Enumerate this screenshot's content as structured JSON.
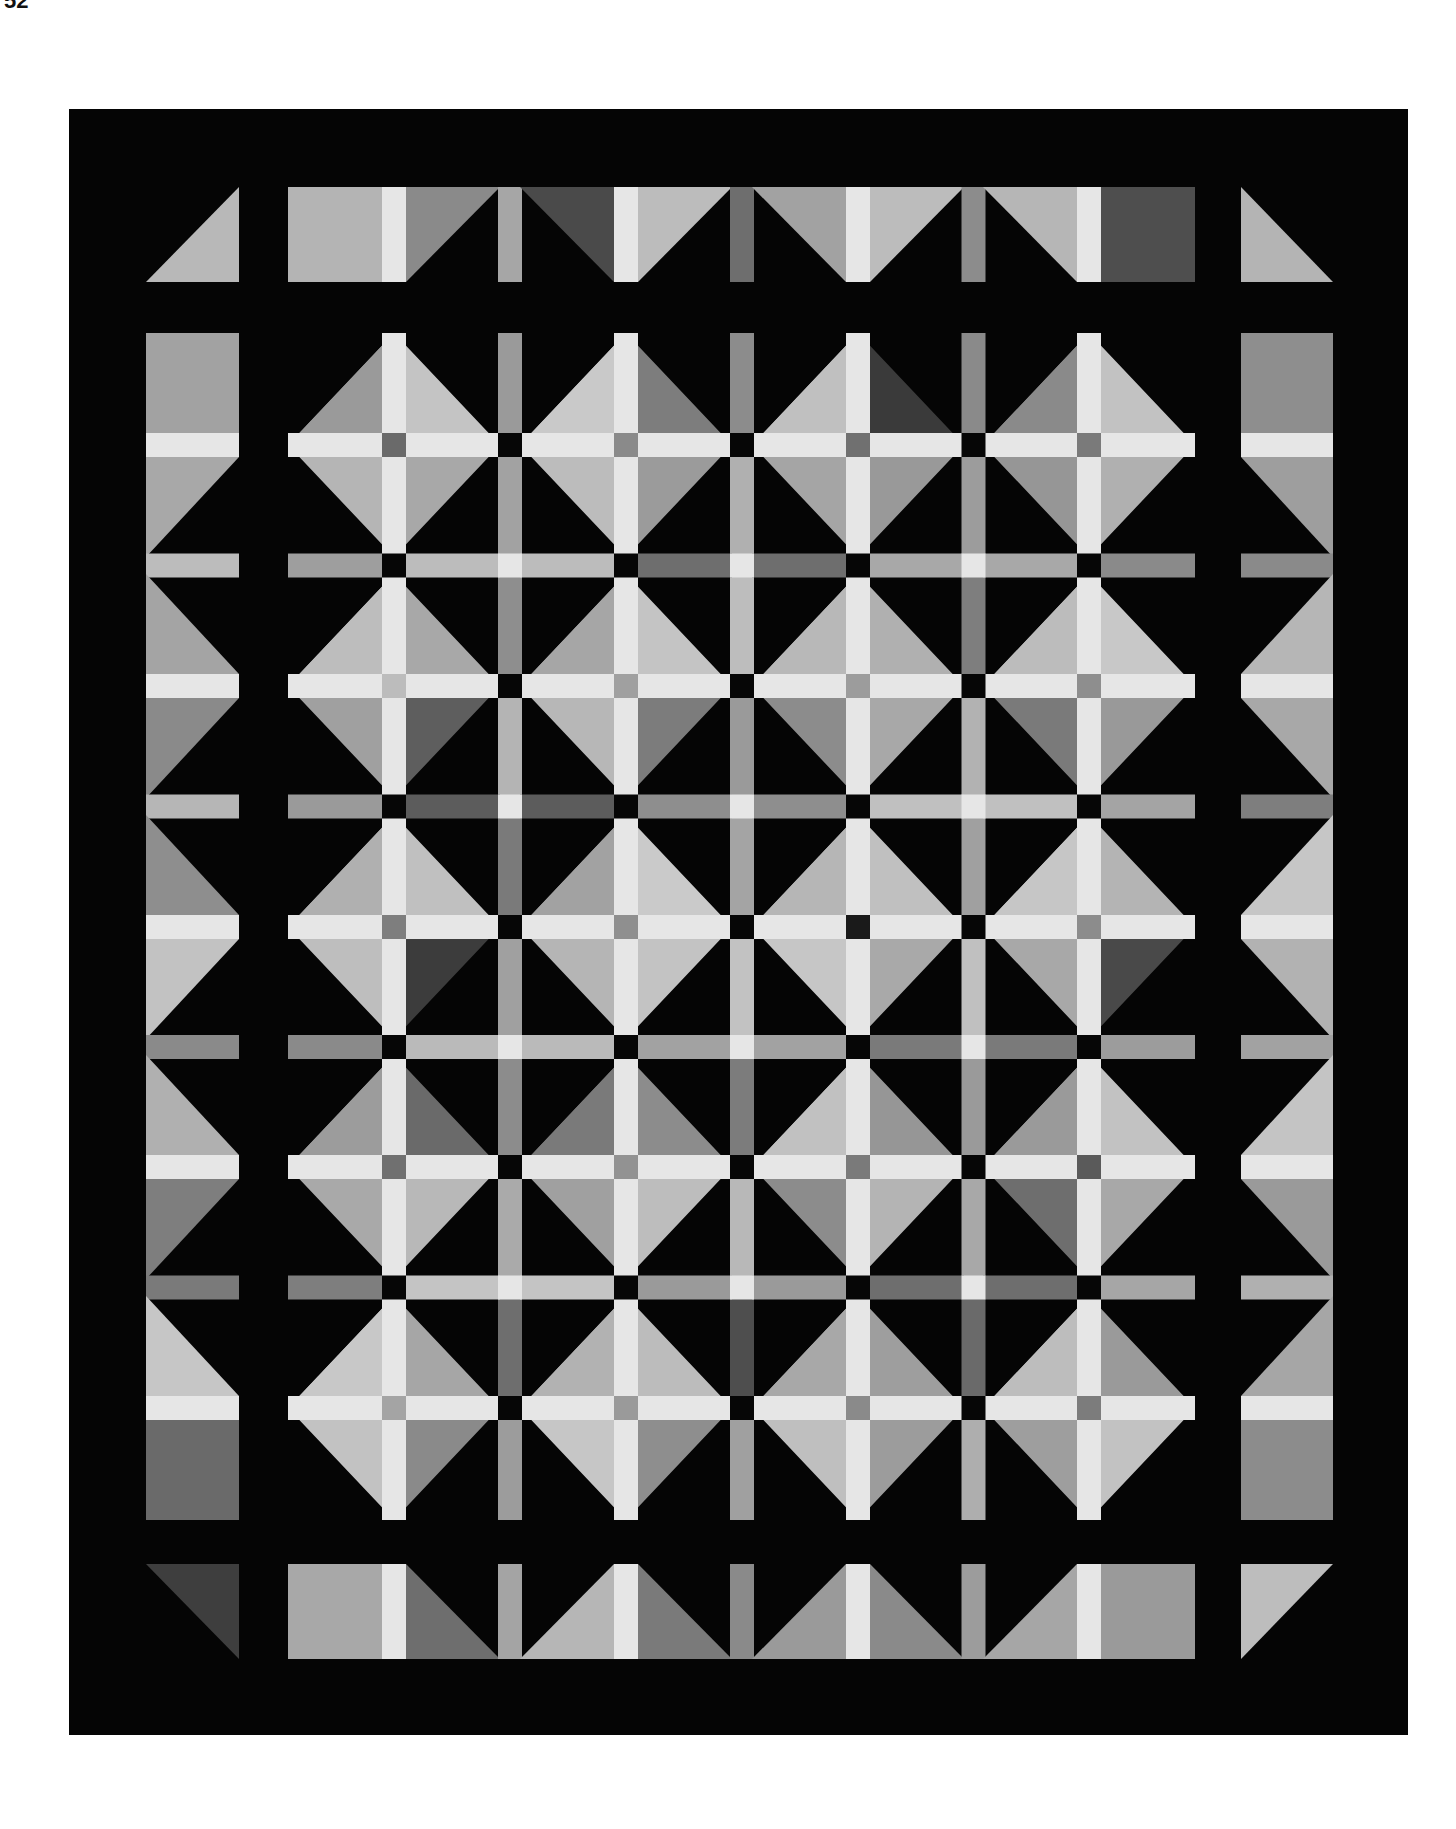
{
  "page": {
    "number": "52",
    "background": "#ffffff"
  },
  "quilt": {
    "description": "Grayscale photograph of a pieced quilt: diamond blocks split by light cross sashing on a black background",
    "colors": {
      "background": "#050505",
      "sashing": "#e6e6e6",
      "intersection": "#060606"
    },
    "bounds": {
      "x": 69,
      "y": 109,
      "w": 1339,
      "h": 1626
    },
    "grid": {
      "cols": 4,
      "rows": 5,
      "col_centers": [
        394,
        626,
        858,
        1089
      ],
      "row_centers": [
        445,
        686,
        927,
        1167,
        1408
      ],
      "half_w": 106,
      "half_h": 112,
      "sash": 24
    },
    "blocks": [
      {
        "tl": "#9a9a9a",
        "tr": "#c4c4c4",
        "bl": "#b5b5b5",
        "br": "#a8a8a8",
        "center": "#6a6a6a"
      },
      {
        "tl": "#c9c9c9",
        "tr": "#7d7d7d",
        "bl": "#bcbcbc",
        "br": "#9b9b9b",
        "center": "#8a8a8a"
      },
      {
        "tl": "#c0c0c0",
        "tr": "#3a3a3a",
        "bl": "#a5a5a5",
        "br": "#999999",
        "center": "#707070"
      },
      {
        "tl": "#8a8a8a",
        "tr": "#c2c2c2",
        "bl": "#969696",
        "br": "#b0b0b0",
        "center": "#7a7a7a"
      },
      {
        "tl": "#bdbdbd",
        "tr": "#a8a8a8",
        "bl": "#a0a0a0",
        "br": "#5e5e5e",
        "center": "#bcbcbc"
      },
      {
        "tl": "#a6a6a6",
        "tr": "#c4c4c4",
        "bl": "#b7b7b7",
        "br": "#7c7c7c",
        "center": "#a0a0a0"
      },
      {
        "tl": "#b8b8b8",
        "tr": "#b0b0b0",
        "bl": "#8c8c8c",
        "br": "#a8a8a8",
        "center": "#9c9c9c"
      },
      {
        "tl": "#bcbcbc",
        "tr": "#c8c8c8",
        "bl": "#7a7a7a",
        "br": "#999999",
        "center": "#8e8e8e"
      },
      {
        "tl": "#b0b0b0",
        "tr": "#c0c0c0",
        "bl": "#bebebe",
        "br": "#3c3c3c",
        "center": "#7e7e7e"
      },
      {
        "tl": "#a2a2a2",
        "tr": "#cacaca",
        "bl": "#b5b5b5",
        "br": "#c3c3c3",
        "center": "#8f8f8f"
      },
      {
        "tl": "#b6b6b6",
        "tr": "#c0c0c0",
        "bl": "#c6c6c6",
        "br": "#a9a9a9",
        "center": "#1a1a1a"
      },
      {
        "tl": "#c6c6c6",
        "tr": "#b4b4b4",
        "bl": "#a8a8a8",
        "br": "#494949",
        "center": "#8c8c8c"
      },
      {
        "tl": "#9c9c9c",
        "tr": "#6a6a6a",
        "bl": "#a9a9a9",
        "br": "#b8b8b8",
        "center": "#707070"
      },
      {
        "tl": "#7a7a7a",
        "tr": "#8c8c8c",
        "bl": "#a0a0a0",
        "br": "#bdbdbd",
        "center": "#929292"
      },
      {
        "tl": "#c1c1c1",
        "tr": "#969696",
        "bl": "#8c8c8c",
        "br": "#b4b4b4",
        "center": "#7a7a7a"
      },
      {
        "tl": "#9a9a9a",
        "tr": "#c2c2c2",
        "bl": "#6e6e6e",
        "br": "#a8a8a8",
        "center": "#5a5a5a"
      },
      {
        "tl": "#c8c8c8",
        "tr": "#a6a6a6",
        "bl": "#c2c2c2",
        "br": "#8a8a8a",
        "center": "#a4a4a4"
      },
      {
        "tl": "#b2b2b2",
        "tr": "#bcbcbc",
        "bl": "#c6c6c6",
        "br": "#8e8e8e",
        "center": "#9a9a9a"
      },
      {
        "tl": "#a8a8a8",
        "tr": "#9e9e9e",
        "bl": "#bfbfbf",
        "br": "#9c9c9c",
        "center": "#8a8a8a"
      },
      {
        "tl": "#bdbdbd",
        "tr": "#9a9a9a",
        "bl": "#9e9e9e",
        "br": "#c2c2c2",
        "center": "#7c7c7c"
      }
    ],
    "vertical_sashing_tones": [
      [
        "#9a9a9a",
        "#a2a2a2",
        "#8e8e8e",
        "#b4b4b4",
        "#7a7a7a",
        "#a0a0a0",
        "#8c8c8c",
        "#aaaaaa",
        "#6e6e6e",
        "#9c9c9c"
      ],
      [
        "#8c8c8c",
        "#b0b0b0",
        "#bdbdbd",
        "#9a9a9a",
        "#a4a4a4",
        "#c2c2c2",
        "#7c7c7c",
        "#b8b8b8",
        "#4e4e4e",
        "#a0a0a0"
      ],
      [
        "#8a8a8a",
        "#9c9c9c",
        "#7e7e7e",
        "#b2b2b2",
        "#a0a0a0",
        "#c0c0c0",
        "#9a9a9a",
        "#a8a8a8",
        "#6a6a6a",
        "#aeaeae"
      ]
    ],
    "horizontal_sashing_tones": [
      [
        "#9e9e9e",
        "#bcbcbc",
        "#6e6e6e",
        "#a8a8a8",
        "#8a8a8a"
      ],
      [
        "#9a9a9a",
        "#5c5c5c",
        "#8e8e8e",
        "#c0c0c0",
        "#a4a4a4"
      ],
      [
        "#8a8a8a",
        "#bababa",
        "#a2a2a2",
        "#7a7a7a",
        "#9c9c9c"
      ],
      [
        "#7e7e7e",
        "#c4c4c4",
        "#9a9a9a",
        "#6e6e6e",
        "#a6a6a6"
      ]
    ],
    "side_left": {
      "x": 146,
      "w": 93,
      "pieces_tones": [
        {
          "top": "#a2a2a2",
          "bottom": "#a8a8a8"
        },
        {
          "top": "#a4a4a4",
          "bottom": "#8a8a8a"
        },
        {
          "top": "#8e8e8e",
          "bottom": "#c2c2c2"
        },
        {
          "top": "#b0b0b0",
          "bottom": "#7e7e7e"
        },
        {
          "top": "#c6c6c6",
          "bottom": "#6a6a6a"
        }
      ],
      "strip_tones": [
        "#bcbcbc",
        "#b6b6b6",
        "#8a8a8a",
        "#7a7a7a"
      ]
    },
    "side_right": {
      "x": 1241,
      "w": 92,
      "pieces_tones": [
        {
          "top": "#8e8e8e",
          "bottom": "#9e9e9e"
        },
        {
          "top": "#b6b6b6",
          "bottom": "#a8a8a8"
        },
        {
          "top": "#c6c6c6",
          "bottom": "#b2b2b2"
        },
        {
          "top": "#c4c4c4",
          "bottom": "#9a9a9a"
        },
        {
          "top": "#a6a6a6",
          "bottom": "#8c8c8c"
        }
      ],
      "strip_tones": [
        "#8a8a8a",
        "#7e7e7e",
        "#a2a2a2",
        "#b0b0b0"
      ]
    },
    "top_row": {
      "y": 187,
      "h": 95,
      "pieces_tones": [
        {
          "left": "#b4b4b4",
          "right": "#8a8a8a"
        },
        {
          "left": "#4a4a4a",
          "right": "#bcbcbc"
        },
        {
          "left": "#a2a2a2",
          "right": "#bcbcbc"
        },
        {
          "left": "#b6b6b6",
          "right": "#4e4e4e"
        }
      ],
      "strip_tones": [
        "#a6a6a6",
        "#6e6e6e",
        "#8c8c8c"
      ],
      "corner_left": "#b8b8b8",
      "corner_right": "#b4b4b4"
    },
    "bottom_row": {
      "y": 1564,
      "h": 95,
      "pieces_tones": [
        {
          "left": "#a8a8a8",
          "right": "#6e6e6e"
        },
        {
          "left": "#b6b6b6",
          "right": "#7a7a7a"
        },
        {
          "left": "#9a9a9a",
          "right": "#8a8a8a"
        },
        {
          "left": "#a6a6a6",
          "right": "#9a9a9a"
        }
      ],
      "strip_tones": [
        "#a4a4a4",
        "#8a8a8a",
        "#9c9c9c"
      ],
      "corner_left": "#3e3e3e",
      "corner_right": "#bdbdbd"
    }
  }
}
